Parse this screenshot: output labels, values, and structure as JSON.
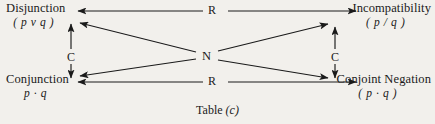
{
  "diagram": {
    "caption_text": "Table",
    "caption_letter": "(c)",
    "nodes": {
      "disjunction": {
        "name": "Disjunction",
        "formula": "( p v q )"
      },
      "incompatibility": {
        "name": "Incompatibility",
        "formula": "( p / q )"
      },
      "conjunction": {
        "name": "Conjunction",
        "formula": "p · q"
      },
      "conjoint_negation": {
        "name": "Conjoint Negation",
        "formula": "( p · q )"
      }
    },
    "edge_labels": {
      "r_top": "R",
      "r_bottom": "R",
      "c_left": "C",
      "c_right": "C",
      "n_center": "N"
    },
    "colors": {
      "background": "#f2f0ec",
      "ink": "#1a1a1a"
    }
  }
}
